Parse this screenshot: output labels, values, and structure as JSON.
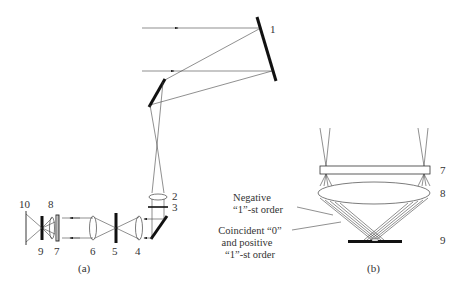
{
  "figure": {
    "panel_a": {
      "caption": "(a)",
      "labels": {
        "l1": "1",
        "l2": "2",
        "l3": "3",
        "l4": "4",
        "l5": "5",
        "l6": "6",
        "l7": "7",
        "l8": "8",
        "l9": "9",
        "l10": "10"
      }
    },
    "panel_b": {
      "caption": "(b)",
      "labels": {
        "l7": "7",
        "l8": "8",
        "l9": "9"
      },
      "annotations": {
        "negative_line1": "Negative",
        "negative_line2": "“1”-st order",
        "coincident_line1": "Coincident “0”",
        "coincident_line2": "and positive",
        "coincident_line3": "“1”-st order"
      }
    }
  }
}
